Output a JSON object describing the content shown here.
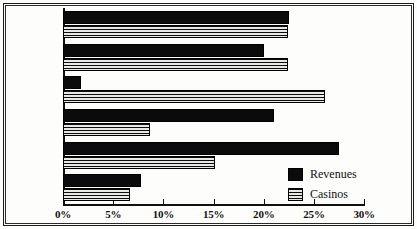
{
  "chart_data": {
    "type": "bar",
    "orientation": "horizontal",
    "title": "",
    "xlabel": "",
    "ylabel": "",
    "xlim": [
      0,
      30
    ],
    "xtick_labels": [
      "0%",
      "5%",
      "10%",
      "15%",
      "20%",
      "25%",
      "30%"
    ],
    "xticks": [
      0,
      5,
      10,
      15,
      20,
      25,
      30
    ],
    "grid": false,
    "legend_position": "inside-bottom-right",
    "categories": [
      "Asia & Pacific",
      "Africa",
      "North America",
      "Middle East",
      "South America",
      "Europe"
    ],
    "category_lines": [
      [
        "Asia &",
        "Pacific"
      ],
      [
        "Africa"
      ],
      [
        "North",
        "America"
      ],
      [
        "Middle",
        "East"
      ],
      [
        "South",
        "America"
      ],
      [
        "Europe"
      ]
    ],
    "series": [
      {
        "name": "Revenues",
        "color": "#0b0b0b",
        "pattern": "solid",
        "values": [
          22.5,
          20.0,
          1.8,
          21.0,
          27.5,
          7.8
        ]
      },
      {
        "name": "Casinos",
        "color": "#0d0d0d",
        "pattern": "horizontal-stripes",
        "values": [
          22.4,
          22.4,
          26.1,
          8.7,
          15.1,
          6.7
        ]
      }
    ]
  },
  "legend": {
    "items": [
      {
        "label": "Revenues"
      },
      {
        "label": "Casinos"
      }
    ]
  }
}
